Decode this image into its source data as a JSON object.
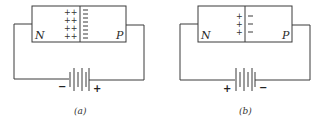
{
  "figure": {
    "panels": [
      {
        "id": "a",
        "caption": "(a)",
        "left_region_label": "N",
        "right_region_label": "P",
        "depletion_width": "wide",
        "positive_charges": [
          "++",
          "++",
          "++",
          "++"
        ],
        "negative_charges": [
          "−",
          "−",
          "−",
          "−",
          "−",
          "−",
          "−",
          "−"
        ],
        "battery_left_terminal": "−",
        "battery_right_terminal": "+",
        "bias": "reverse"
      },
      {
        "id": "b",
        "caption": "(b)",
        "left_region_label": "N",
        "right_region_label": "P",
        "depletion_width": "narrow",
        "positive_charges": [
          "+",
          "+",
          "+"
        ],
        "negative_charges": [
          "−",
          "−",
          "−"
        ],
        "battery_left_terminal": "+",
        "battery_right_terminal": "−",
        "bias": "forward"
      }
    ],
    "colors": {
      "line": "#3a3a3a",
      "text": "#2a2a2a",
      "background": "#ffffff"
    }
  }
}
